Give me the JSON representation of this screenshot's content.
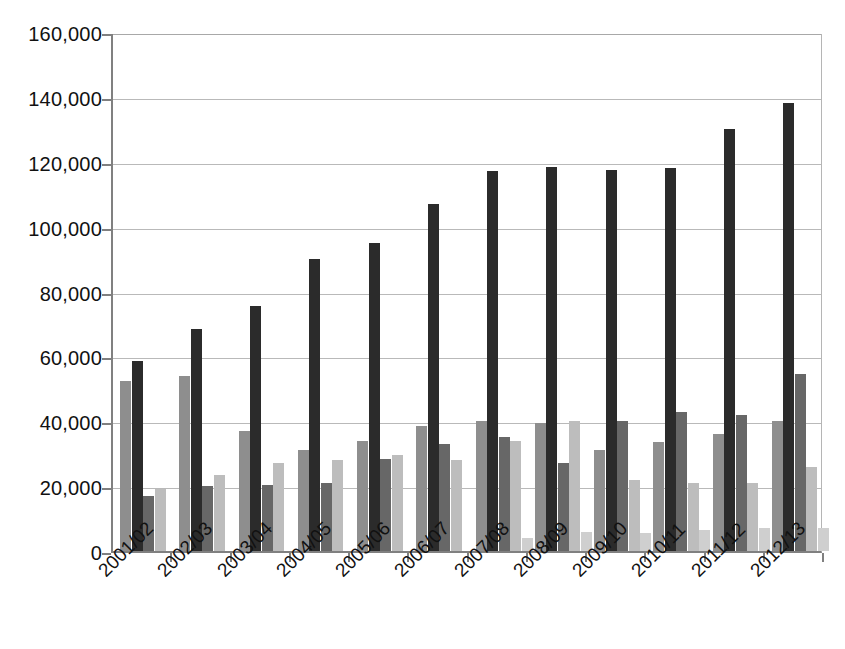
{
  "chart_data": {
    "type": "bar",
    "title": "",
    "subtitle": "",
    "xlabel": "",
    "ylabel": "",
    "ylim": [
      0,
      160000
    ],
    "ytick_values": [
      0,
      20000,
      40000,
      60000,
      80000,
      100000,
      120000,
      140000,
      160000
    ],
    "ytick_labels": [
      "0",
      "20,000",
      "40,000",
      "60,000",
      "80,000",
      "100,000",
      "120,000",
      "140,000",
      "160,000"
    ],
    "grid": true,
    "legend": "none",
    "categories": [
      "2001/02",
      "2002/03",
      "2003/04",
      "2004/05",
      "2005/06",
      "2006/07",
      "2007/08",
      "2008/09",
      "2009/10",
      "2010/11",
      "2011/12",
      "2012/13"
    ],
    "series": [
      {
        "name": "Series 1",
        "color": "#8e8e8e",
        "values": [
          52500,
          54000,
          37000,
          31000,
          34000,
          38500,
          40000,
          39500,
          31000,
          33500,
          36000,
          40000
        ]
      },
      {
        "name": "Series 2",
        "color": "#2b2b2b",
        "values": [
          58500,
          68500,
          75500,
          90000,
          95000,
          107000,
          117000,
          118500,
          117500,
          118000,
          130000,
          138000
        ]
      },
      {
        "name": "Series 3",
        "color": "#676767",
        "values": [
          17000,
          20000,
          20500,
          21000,
          28500,
          33000,
          35000,
          27000,
          40000,
          43000,
          42000,
          54500
        ]
      },
      {
        "name": "Series 4",
        "color": "#bdbdbd",
        "values": [
          19000,
          23500,
          27000,
          28000,
          29500,
          28000,
          34000,
          40000,
          22000,
          21000,
          21000,
          26000
        ]
      },
      {
        "name": "Series 5",
        "color": "#cfcfcf",
        "values": [
          0,
          0,
          0,
          0,
          0,
          0,
          4000,
          6000,
          5500,
          6500,
          7000,
          7000
        ]
      }
    ]
  },
  "colors": {
    "background": "#ffffff",
    "axis": "#808080",
    "gridline": "#b9b9b9",
    "text": "#111111"
  }
}
